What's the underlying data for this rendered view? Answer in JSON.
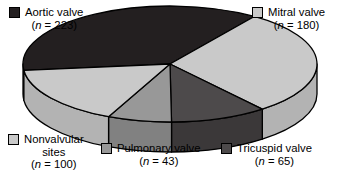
{
  "chart_data": {
    "type": "pie",
    "title": "",
    "subtitle": "",
    "xlabel": "",
    "ylabel": "",
    "total": 611,
    "three_d": true,
    "legend_position": "around-chart",
    "grid": false,
    "categories": [
      "Aortic valve",
      "Mitral valve",
      "Tricuspid valve",
      "Pulmonary valve",
      "Nonvalvular sites"
    ],
    "values": [
      223,
      180,
      65,
      43,
      100
    ],
    "slices": [
      {
        "label": "Aortic valve",
        "value": 223,
        "value_text": "(n = 223)",
        "percent": 36.5,
        "color": "#231f20",
        "side_color": "#141112",
        "start_angle": 55,
        "sweep": 131.4
      },
      {
        "label": "Mitral valve",
        "value": 180,
        "value_text": "(n = 180)",
        "percent": 29.5,
        "color": "#c9c9c9",
        "side_color": "#b3b3b3",
        "start_angle": 308.9,
        "sweep": 106.1
      },
      {
        "label": "Tricuspid valve",
        "value": 65,
        "value_text": "(n = 65)",
        "percent": 10.6,
        "color": "#4d4a4b",
        "side_color": "#3b3839",
        "start_angle": 270.6,
        "sweep": 38.3
      },
      {
        "label": "Pulmonary valve",
        "value": 43,
        "value_text": "(n = 43)",
        "percent": 7.0,
        "color": "#989898",
        "side_color": "#818181",
        "start_angle": 245.3,
        "sweep": 25.3
      },
      {
        "label": "Nonvalvular sites",
        "value": 100,
        "value_text": "(n = 100)",
        "percent": 16.4,
        "color": "#c9c9c9",
        "side_color": "#b3b3b3",
        "start_angle": 186.4,
        "sweep": 58.9
      }
    ]
  },
  "legend": {
    "aortic": {
      "label": "Aortic valve",
      "count_open": "(",
      "count_n": "n",
      "count_rest": " = 223)",
      "color": "#231f20"
    },
    "mitral": {
      "label": "Mitral valve",
      "count_open": "(",
      "count_n": "n",
      "count_rest": " = 180)",
      "color": "#c9c9c9"
    },
    "nonvalvular": {
      "label": "Nonvalvular",
      "label2": "sites",
      "count_open": "(",
      "count_n": "n",
      "count_rest": " = 100)",
      "color": "#c9c9c9"
    },
    "pulmonary": {
      "label": "Pulmonary valve",
      "count_open": "(",
      "count_n": "n",
      "count_rest": " = 43)",
      "color": "#989898"
    },
    "tricuspid": {
      "label": "Tricuspid valve",
      "count_open": "(",
      "count_n": "n",
      "count_rest": " = 65)",
      "color": "#4d4a4b"
    }
  },
  "style": {
    "background": "#ffffff",
    "outline": "#000000"
  }
}
